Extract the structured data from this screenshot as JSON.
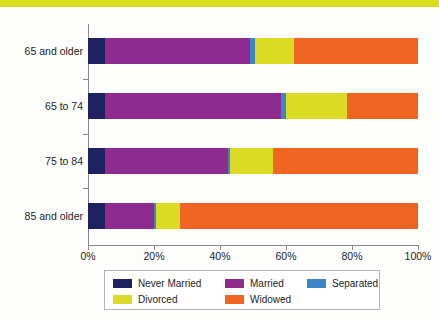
{
  "title_band": {
    "text": "",
    "color": "#d9de20"
  },
  "chart_data": {
    "type": "bar",
    "orientation": "horizontal",
    "stacked": true,
    "normalized": true,
    "title": "",
    "xlabel": "",
    "ylabel": "",
    "xlim": [
      0,
      100
    ],
    "xticks": [
      0,
      20,
      40,
      60,
      80,
      100
    ],
    "xtick_labels": [
      "0%",
      "20%",
      "40%",
      "60%",
      "80%",
      "100%"
    ],
    "grid": false,
    "legend_position": "bottom",
    "categories": [
      "65 and older",
      "65 to 74",
      "75 to 84",
      "85 and older"
    ],
    "series": [
      {
        "name": "Never Married",
        "color": "#1f2160",
        "values": [
          5.0,
          5.0,
          5.0,
          5.0
        ]
      },
      {
        "name": "Married",
        "color": "#8f2b8f",
        "values": [
          44.0,
          53.5,
          37.5,
          15.0
        ]
      },
      {
        "name": "Separated",
        "color": "#3d86c6",
        "values": [
          1.5,
          1.5,
          0.5,
          0.5
        ]
      },
      {
        "name": "Divorced",
        "color": "#dbdb25",
        "values": [
          12.0,
          18.5,
          13.0,
          7.5
        ]
      },
      {
        "name": "Widowed",
        "color": "#ef6521",
        "values": [
          37.5,
          21.5,
          44.0,
          72.0
        ]
      }
    ]
  },
  "legend": {
    "entries": [
      {
        "label": "Never Married",
        "color": "#1f2160"
      },
      {
        "label": "Married",
        "color": "#8f2b8f"
      },
      {
        "label": "Separated",
        "color": "#3d86c6"
      },
      {
        "label": "Divorced",
        "color": "#dbdb25"
      },
      {
        "label": "Widowed",
        "color": "#ef6521"
      }
    ]
  }
}
